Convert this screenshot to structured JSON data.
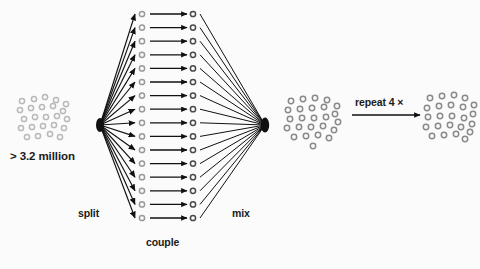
{
  "figure": {
    "type": "diagram",
    "background_color": "#fbfbfb",
    "ink_color": "#111111",
    "bead_color": "#8a8a8a",
    "bead_color_light": "#b9b9b9"
  },
  "labels": {
    "millions": "> 3.2 million",
    "split": "split",
    "couple": "couple",
    "mix": "mix",
    "repeat": "repeat 4 ×"
  },
  "clusters": [
    {
      "name": "starting-bead-pool",
      "cx": 45,
      "cy": 120,
      "count": 24,
      "radius": 2.6,
      "stroke": "#b9b9b9",
      "points": [
        [
          22,
          101
        ],
        [
          34,
          99
        ],
        [
          45,
          97
        ],
        [
          56,
          100
        ],
        [
          66,
          104
        ],
        [
          20,
          110
        ],
        [
          31,
          108
        ],
        [
          42,
          107
        ],
        [
          53,
          106
        ],
        [
          63,
          111
        ],
        [
          24,
          119
        ],
        [
          35,
          117
        ],
        [
          46,
          117
        ],
        [
          57,
          116
        ],
        [
          67,
          119
        ],
        [
          21,
          128
        ],
        [
          32,
          127
        ],
        [
          43,
          126
        ],
        [
          54,
          125
        ],
        [
          64,
          128
        ],
        [
          27,
          137
        ],
        [
          38,
          136
        ],
        [
          50,
          134
        ],
        [
          60,
          137
        ]
      ]
    },
    {
      "name": "pooled-bead-library",
      "cx": 312,
      "cy": 124,
      "count": 25,
      "radius": 2.7,
      "stroke": "#8a8a8a",
      "points": [
        [
          291,
          101
        ],
        [
          303,
          99
        ],
        [
          315,
          98
        ],
        [
          327,
          100
        ],
        [
          337,
          106
        ],
        [
          288,
          110
        ],
        [
          300,
          109
        ],
        [
          312,
          108
        ],
        [
          324,
          107
        ],
        [
          335,
          114
        ],
        [
          290,
          119
        ],
        [
          302,
          118
        ],
        [
          314,
          118
        ],
        [
          326,
          117
        ],
        [
          338,
          122
        ],
        [
          287,
          128
        ],
        [
          299,
          127
        ],
        [
          311,
          127
        ],
        [
          323,
          126
        ],
        [
          334,
          130
        ],
        [
          294,
          137
        ],
        [
          306,
          136
        ],
        [
          318,
          135
        ],
        [
          329,
          138
        ],
        [
          313,
          146
        ]
      ]
    },
    {
      "name": "final-bead-library",
      "cx": 450,
      "cy": 120,
      "count": 24,
      "radius": 2.7,
      "stroke": "#8a8a8a",
      "points": [
        [
          430,
          98
        ],
        [
          442,
          96
        ],
        [
          454,
          95
        ],
        [
          465,
          98
        ],
        [
          474,
          105
        ],
        [
          427,
          108
        ],
        [
          439,
          106
        ],
        [
          451,
          105
        ],
        [
          463,
          107
        ],
        [
          473,
          114
        ],
        [
          428,
          117
        ],
        [
          440,
          116
        ],
        [
          452,
          116
        ],
        [
          464,
          118
        ],
        [
          472,
          124
        ],
        [
          426,
          127
        ],
        [
          438,
          126
        ],
        [
          450,
          125
        ],
        [
          461,
          127
        ],
        [
          470,
          132
        ],
        [
          432,
          136
        ],
        [
          444,
          135
        ],
        [
          456,
          134
        ],
        [
          465,
          139
        ]
      ]
    }
  ],
  "columns": {
    "left": {
      "name": "resin-column-pre-coupling",
      "x": 142,
      "count": 16,
      "y_start": 14,
      "y_step": 13.6,
      "radius": 2.6,
      "stroke": "#9a9a9a"
    },
    "right": {
      "name": "resin-column-post-coupling",
      "x": 193,
      "count": 16,
      "y_start": 14,
      "y_step": 13.6,
      "radius": 2.6,
      "stroke": "#4a4a4a"
    }
  },
  "fans": {
    "split_fan": {
      "name": "split-fan-arrows",
      "origin_x": 100,
      "origin_y": 125,
      "target_x": 135,
      "arrow_count": 16,
      "arrowhead": true
    },
    "mix_fan": {
      "name": "mix-fan-lines",
      "origin_x": 265,
      "origin_y": 125,
      "source_x": 200,
      "line_count": 16,
      "arrowhead": false
    }
  },
  "couple_arrows": {
    "name": "couple-arrows",
    "count": 16,
    "x_start": 150,
    "x_end": 187,
    "arrowhead": true
  },
  "repeat_arrow": {
    "name": "repeat-arrow",
    "x_start": 352,
    "x_end": 420,
    "y": 115,
    "arrowhead": true
  }
}
